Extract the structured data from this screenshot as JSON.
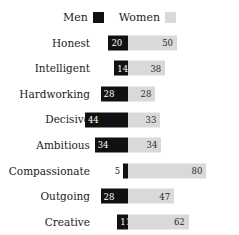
{
  "legend": {
    "entries": [
      {
        "label": "Men",
        "swatch_name": "legend-swatch-men",
        "color": "#111111"
      },
      {
        "label": "Women",
        "swatch_name": "legend-swatch-women",
        "color": "#d9d9d9"
      }
    ]
  },
  "colors": {
    "men": "#111111",
    "women": "#d9d9d9",
    "background": "#ffffff",
    "text": "#1a1a1a",
    "value_on_dark": "#ffffff",
    "value_on_light": "#2b2b2b"
  },
  "chart_data": {
    "type": "bar",
    "subtype": "diverging-horizontal",
    "title": "",
    "xlabel": "",
    "ylabel": "",
    "grid": false,
    "legend_position": "top-center",
    "axis_note": "Bars diverge from a common central pivot; Men extend left, Women extend right. Approximately 1 pixel per unit on each side.",
    "pivot_value": 0,
    "xlim_left": [
      0,
      45
    ],
    "xlim_right": [
      0,
      85
    ],
    "categories": [
      "Honest",
      "Intelligent",
      "Hardworking",
      "Decisive",
      "Ambitious",
      "Compassionate",
      "Outgoing",
      "Creative"
    ],
    "series": [
      {
        "name": "Men",
        "color": "#111111",
        "direction": "left",
        "values": [
          20,
          14,
          28,
          44,
          34,
          5,
          28,
          11
        ]
      },
      {
        "name": "Women",
        "color": "#d9d9d9",
        "direction": "right",
        "values": [
          50,
          38,
          28,
          33,
          34,
          80,
          47,
          62
        ]
      }
    ],
    "rows": [
      {
        "category": "Honest",
        "men": 20,
        "women": 50,
        "men_label_outside": false
      },
      {
        "category": "Intelligent",
        "men": 14,
        "women": 38,
        "men_label_outside": false
      },
      {
        "category": "Hardworking",
        "men": 28,
        "women": 28,
        "men_label_outside": false
      },
      {
        "category": "Decisive",
        "men": 44,
        "women": 33,
        "men_label_outside": false
      },
      {
        "category": "Ambitious",
        "men": 34,
        "women": 34,
        "men_label_outside": false
      },
      {
        "category": "Compassionate",
        "men": 5,
        "women": 80,
        "men_label_outside": true
      },
      {
        "category": "Outgoing",
        "men": 28,
        "women": 47,
        "men_label_outside": false
      },
      {
        "category": "Creative",
        "men": 11,
        "women": 62,
        "men_label_outside": false
      }
    ]
  }
}
